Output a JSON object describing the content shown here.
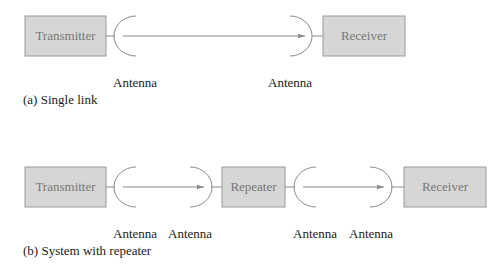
{
  "diagram_a": {
    "caption": "(a) Single link",
    "transmitter": "Transmitter",
    "receiver": "Receiver",
    "antenna_left": "Antenna",
    "antenna_right": "Antenna"
  },
  "diagram_b": {
    "caption": "(b) System with repeater",
    "transmitter": "Transmitter",
    "repeater": "Repeater",
    "receiver": "Receiver",
    "antenna_1": "Antenna",
    "antenna_2": "Antenna",
    "antenna_3": "Antenna",
    "antenna_4": "Antenna"
  },
  "colors": {
    "box_fill": "#d6d6d6",
    "box_stroke": "#9a9a9a",
    "box_text": "#777777",
    "line": "#8a8a8a",
    "label_text": "#222222"
  }
}
